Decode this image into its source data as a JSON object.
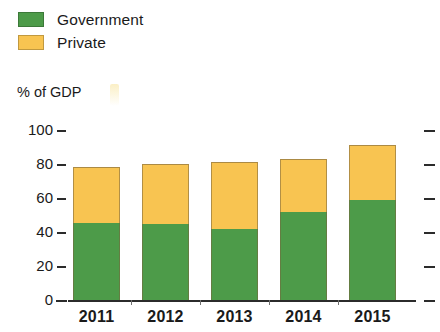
{
  "chart_data": {
    "type": "bar",
    "subtype": "stacked-vertical",
    "title": "",
    "subtitle": "",
    "xlabel": "",
    "ylabel": "% of GDP",
    "categories": [
      "2011",
      "2012",
      "2013",
      "2014",
      "2015"
    ],
    "series": [
      {
        "name": "Government",
        "color": "#4d9b49",
        "values": [
          45,
          45,
          42,
          52,
          59
        ]
      },
      {
        "name": "Private",
        "color": "#f8c451",
        "values": [
          33,
          35,
          39,
          31,
          32
        ]
      }
    ],
    "totals": [
      78,
      80,
      81,
      83,
      91
    ],
    "ylim": [
      0,
      100
    ],
    "yticks": [
      0,
      20,
      40,
      60,
      80,
      100
    ],
    "ytick_labels": [
      "0",
      "20",
      "40",
      "60",
      "80",
      "100"
    ],
    "grid": false,
    "right_axis_ticks": true,
    "legend": {
      "position": "top-left",
      "entries": [
        "Government",
        "Private"
      ]
    }
  },
  "legend": {
    "items": [
      {
        "label": "Government",
        "color": "#4d9b49"
      },
      {
        "label": "Private",
        "color": "#f8c451"
      }
    ]
  },
  "axis": {
    "caption": "% of GDP",
    "y_labels": [
      "100",
      "80",
      "60",
      "40",
      "20",
      "0"
    ],
    "x_labels": [
      "2011",
      "2012",
      "2013",
      "2014",
      "2015"
    ]
  },
  "colors": {
    "government": "#4d9b49",
    "private": "#f8c451",
    "axis": "#2b2b2b",
    "text": "#1a1a1a",
    "background": "#ffffff"
  }
}
